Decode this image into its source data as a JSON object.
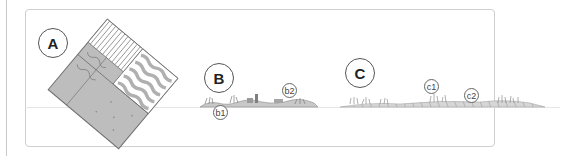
{
  "figure": {
    "panels": [
      {
        "id": "A",
        "label": "A",
        "description": "rotated block diagram with vegetation strips and soil layers"
      },
      {
        "id": "B",
        "label": "B",
        "description": "low profile with sparse vegetation and small structures",
        "callouts": [
          "b1",
          "b2"
        ]
      },
      {
        "id": "C",
        "label": "C",
        "description": "elongated profile with grass clumps and hatched ground",
        "callouts": [
          "c1",
          "c2"
        ]
      }
    ],
    "colors": {
      "frame": "#cfcfcf",
      "ground_fill": "#b9b9b9",
      "stroke": "#6f6f6f",
      "label_border": "#555555"
    }
  }
}
